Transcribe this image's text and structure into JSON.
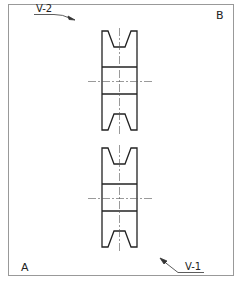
{
  "drawing": {
    "title": "V-belt pulley layout",
    "colors": {
      "line": "#222222",
      "frame": "#999999",
      "center": "#555555",
      "background": "#ffffff"
    },
    "corner_labels": {
      "top_right": "B",
      "bottom_left": "A"
    },
    "view_labels": {
      "top_left": {
        "text": "V-2",
        "arrow": "pointing down-right"
      },
      "bottom_right": {
        "text": "V-1",
        "arrow": "pointing up-left"
      }
    },
    "pulleys": [
      {
        "name": "upper-pulley",
        "top": 31,
        "bottom": 130,
        "centerline_y": 81
      },
      {
        "name": "lower-pulley",
        "top": 148,
        "bottom": 247,
        "centerline_y": 198
      }
    ]
  }
}
